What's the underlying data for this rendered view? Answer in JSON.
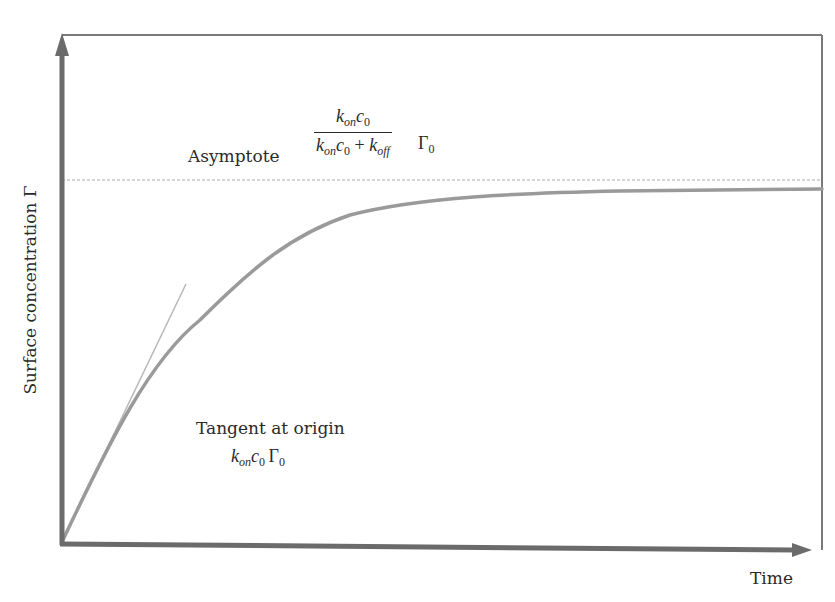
{
  "figure": {
    "type": "diagram",
    "axes": {
      "x_label": "Time",
      "y_label": "Surface concentration Γ"
    },
    "annotations": {
      "asymptote": {
        "label": "Asymptote",
        "numerator": {
          "k": "k",
          "k_sub": "on",
          "c": "c",
          "c_sub": "0"
        },
        "denominator": {
          "k1": "k",
          "k1_sub": "on",
          "c": "c",
          "c_sub": "0",
          "plus": " + ",
          "k2": "k",
          "k2_sub": "off"
        },
        "factor": "Γ",
        "factor_sub": "0"
      },
      "tangent": {
        "label": "Tangent at origin",
        "k": "k",
        "k_sub": "on",
        "c": "c",
        "c_sub": "0",
        "factor": "Γ",
        "factor_sub": "0"
      }
    },
    "colors": {
      "axis": "#6b6b6b",
      "frame": "#7a7a7a",
      "curve": "#9a9a9a",
      "asymptote_line": "#c8c8c8",
      "tangent_line": "#b8b8b8",
      "text": "#2a2a2a"
    }
  }
}
